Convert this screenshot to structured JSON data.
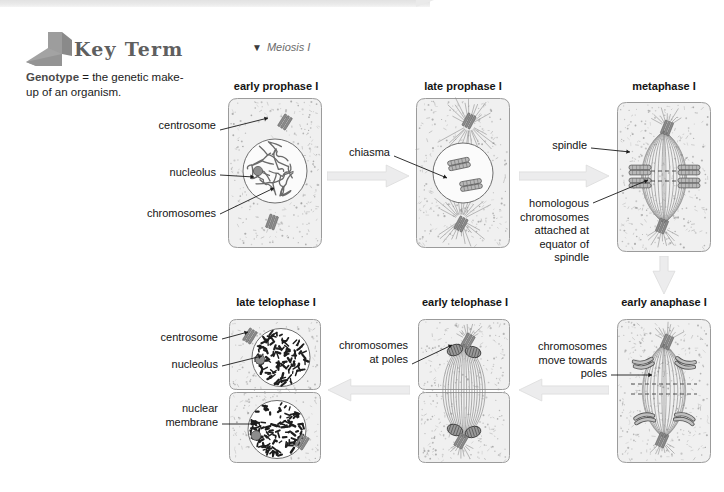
{
  "page": {
    "width": 724,
    "height": 492,
    "background": "#ffffff",
    "banner_color": "#eaeaea"
  },
  "key_term": {
    "icon_name": "bent-corner-flag-icon",
    "icon_color": "#9a9a9a",
    "title": "Key Term",
    "term": "Genotype",
    "definition": "= the genetic make-up of an organism.",
    "title_color": "#5f5f5f"
  },
  "figure": {
    "caption_marker": "▼",
    "caption": "Meiosis I"
  },
  "colors": {
    "cell_fill": "#f0f0f0",
    "cell_stroke": "#9b9b9b",
    "nucleus_fill": "#fbfbfb",
    "nucleolus_fill": "#8d8d8d",
    "chromosome_fill": "#787878",
    "spindle_stroke": "#8a8a8a",
    "speckle": "#9a9a9a",
    "arrow_fill": "#ececed",
    "leader_stroke": "#1a1a1a",
    "text": "#141414"
  },
  "phases": [
    {
      "id": "early-prophase-1",
      "title": "early prophase I",
      "title_x": 228,
      "title_y": 80,
      "title_w": 96,
      "box": {
        "x": 227,
        "y": 97,
        "w": 96,
        "h": 152
      },
      "kind": "prophase-early"
    },
    {
      "id": "late-prophase-1",
      "title": "late prophase I",
      "title_x": 415,
      "title_y": 80,
      "title_w": 96,
      "box": {
        "x": 415,
        "y": 97,
        "w": 96,
        "h": 152
      },
      "kind": "prophase-late"
    },
    {
      "id": "metaphase-1",
      "title": "metaphase I",
      "title_x": 616,
      "title_y": 80,
      "title_w": 96,
      "box": {
        "x": 616,
        "y": 101,
        "w": 96,
        "h": 152
      },
      "kind": "metaphase"
    },
    {
      "id": "early-anaphase-1",
      "title": "early anaphase I",
      "title_x": 612,
      "title_y": 296,
      "title_w": 104,
      "box": {
        "x": 616,
        "y": 318,
        "w": 96,
        "h": 146
      },
      "kind": "anaphase"
    },
    {
      "id": "early-telophase-1",
      "title": "early telophase I",
      "title_x": 413,
      "title_y": 296,
      "title_w": 104,
      "box": {
        "x": 417,
        "y": 318,
        "w": 94,
        "h": 146
      },
      "kind": "telophase-early"
    },
    {
      "id": "late-telophase-1",
      "title": "late telophase I",
      "title_x": 226,
      "title_y": 296,
      "title_w": 100,
      "box": {
        "x": 228,
        "y": 318,
        "w": 94,
        "h": 146
      },
      "kind": "telophase-late"
    }
  ],
  "annotations": [
    {
      "id": "centrosome-top",
      "text": "centrosome",
      "x": 96,
      "y": 119,
      "w": 120,
      "align": "right",
      "leader": [
        [
          220,
          130
        ],
        [
          268,
          118
        ]
      ]
    },
    {
      "id": "nucleolus-top",
      "text": "nucleolus",
      "x": 96,
      "y": 166,
      "w": 120,
      "align": "right",
      "leader": [
        [
          220,
          175
        ],
        [
          254,
          177
        ]
      ]
    },
    {
      "id": "chromosomes-top",
      "text": "chromosomes",
      "x": 86,
      "y": 207,
      "w": 130,
      "align": "right",
      "leader": [
        [
          220,
          214
        ],
        [
          274,
          188
        ]
      ]
    },
    {
      "id": "chiasma",
      "text": "chiasma",
      "x": 300,
      "y": 146,
      "w": 90,
      "align": "right",
      "leader": [
        [
          394,
          156
        ],
        [
          447,
          178
        ]
      ]
    },
    {
      "id": "spindle",
      "text": "spindle",
      "x": 497,
      "y": 139,
      "w": 90,
      "align": "right",
      "leader": [
        [
          591,
          148
        ],
        [
          630,
          152
        ]
      ]
    },
    {
      "id": "homologous-chromosomes",
      "text": "homologous\nchromosomes\nattached at\nequator of\nspindle",
      "x": 515,
      "y": 197,
      "w": 74,
      "align": "right",
      "leader": [
        [
          593,
          203
        ],
        [
          648,
          180
        ]
      ]
    },
    {
      "id": "chromosomes-move-towards-poles",
      "text": "chromosomes\nmove towards\npoles",
      "x": 519,
      "y": 340,
      "w": 88,
      "align": "right",
      "leader": [
        [
          611,
          375
        ],
        [
          652,
          375
        ]
      ]
    },
    {
      "id": "chromosomes-at-poles",
      "text": "chromosomes\nat poles",
      "x": 320,
      "y": 339,
      "w": 88,
      "align": "right",
      "leader": [
        [
          412,
          364
        ],
        [
          452,
          345
        ]
      ]
    },
    {
      "id": "centrosome-bottom",
      "text": "centrosome",
      "x": 130,
      "y": 331,
      "w": 88,
      "align": "right",
      "leader": [
        [
          222,
          339
        ],
        [
          248,
          332
        ]
      ]
    },
    {
      "id": "nucleolus-bottom",
      "text": "nucleolus",
      "x": 130,
      "y": 358,
      "w": 88,
      "align": "right",
      "leader": [
        [
          222,
          366
        ],
        [
          262,
          356
        ]
      ]
    },
    {
      "id": "nuclear-membrane",
      "text": "nuclear\nmembrane",
      "x": 130,
      "y": 402,
      "w": 88,
      "align": "right",
      "leader": [
        [
          222,
          424
        ],
        [
          256,
          424
        ]
      ]
    }
  ],
  "flow_arrows": [
    {
      "id": "arrow-prophase-early-to-late",
      "x": 327,
      "y": 164,
      "dir": "right",
      "w": 82,
      "h": 24
    },
    {
      "id": "arrow-prophase-late-to-metaphase",
      "x": 519,
      "y": 164,
      "dir": "right",
      "w": 90,
      "h": 24
    },
    {
      "id": "arrow-metaphase-to-anaphase",
      "x": 652,
      "y": 256,
      "dir": "down",
      "w": 24,
      "h": 38
    },
    {
      "id": "arrow-anaphase-to-early-telophase",
      "x": 519,
      "y": 378,
      "dir": "left",
      "w": 90,
      "h": 24
    },
    {
      "id": "arrow-early-to-late-telophase",
      "x": 328,
      "y": 378,
      "dir": "left",
      "w": 82,
      "h": 24
    }
  ]
}
